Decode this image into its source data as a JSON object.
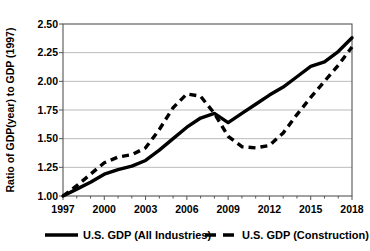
{
  "chart_data": {
    "type": "line",
    "title": "",
    "xlabel": "",
    "ylabel": "Ratio of GDP(year) to GDP (1997)",
    "xlim": [
      1997,
      2018
    ],
    "ylim": [
      1.0,
      2.5
    ],
    "ytick_labels": [
      "1.00",
      "1.25",
      "1.50",
      "1.75",
      "2.00",
      "2.25",
      "2.50"
    ],
    "ytick_values": [
      1.0,
      1.25,
      1.5,
      1.75,
      2.0,
      2.25,
      2.5
    ],
    "xtick_labels": [
      "1997",
      "2000",
      "2003",
      "2006",
      "2009",
      "2012",
      "2015",
      "2018"
    ],
    "xtick_values": [
      1997,
      2000,
      2003,
      2006,
      2009,
      2012,
      2015,
      2018
    ],
    "minor_xticks": [
      1998,
      1999,
      2001,
      2002,
      2004,
      2005,
      2007,
      2008,
      2010,
      2011,
      2013,
      2014,
      2016,
      2017
    ],
    "grid": "horizontal",
    "legend_position": "bottom",
    "x": [
      1997,
      1998,
      1999,
      2000,
      2001,
      2002,
      2003,
      2004,
      2005,
      2006,
      2007,
      2008,
      2009,
      2010,
      2011,
      2012,
      2013,
      2014,
      2015,
      2016,
      2017,
      2018
    ],
    "series": [
      {
        "name": "U.S. GDP (All Industries)",
        "style": "solid",
        "color": "#000000",
        "values": [
          1.0,
          1.06,
          1.12,
          1.19,
          1.23,
          1.26,
          1.31,
          1.4,
          1.5,
          1.6,
          1.68,
          1.72,
          1.64,
          1.72,
          1.8,
          1.88,
          1.95,
          2.04,
          2.13,
          2.17,
          2.26,
          2.38
        ]
      },
      {
        "name": "U.S. GDP (Construction)",
        "style": "dashed",
        "color": "#000000",
        "values": [
          1.0,
          1.09,
          1.19,
          1.29,
          1.34,
          1.36,
          1.42,
          1.58,
          1.77,
          1.89,
          1.87,
          1.72,
          1.52,
          1.43,
          1.42,
          1.44,
          1.55,
          1.71,
          1.86,
          2.0,
          2.14,
          2.3
        ]
      }
    ]
  },
  "legend": {
    "items": [
      {
        "label": "U.S. GDP (All Industries)",
        "style": "solid"
      },
      {
        "label": "U.S. GDP (Construction)",
        "style": "dashed"
      }
    ]
  }
}
